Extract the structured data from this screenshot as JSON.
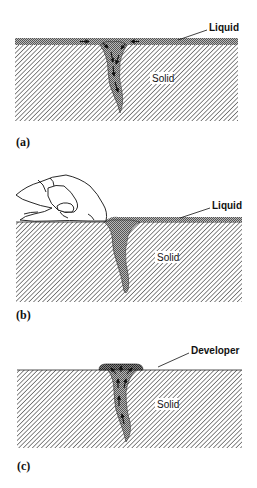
{
  "figure": {
    "panels": [
      {
        "id": "a",
        "label": "(a)",
        "callout": "Liquid",
        "region_label": "Solid",
        "caption_hint": "Liquid penetrant applied to surface, drawn into crack by capillary action"
      },
      {
        "id": "b",
        "label": "(b)",
        "callout": "Liquid",
        "region_label": "Solid",
        "caption_hint": "Excess liquid wiped from surface by hand; liquid remains in crack"
      },
      {
        "id": "c",
        "label": "(c)",
        "callout": "Developer",
        "region_label": "Solid",
        "caption_hint": "Developer draws penetrant out of crack to surface"
      }
    ]
  },
  "colors": {
    "hatch": "#555555",
    "liquid": "#9a9a9a",
    "outline": "#222222",
    "background": "#ffffff"
  }
}
